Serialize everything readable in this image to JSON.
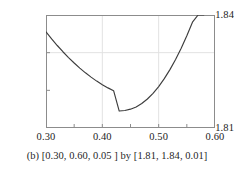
{
  "caption": {
    "text": "(b) [0.30, 0.60, 0.05 ] by [1.81, 1.84, 0.01]"
  },
  "chart_data": {
    "type": "line",
    "title": "",
    "subtitle": "",
    "xlabel": "",
    "ylabel": "",
    "xlim": [
      0.3,
      0.6
    ],
    "ylim": [
      1.81,
      1.84
    ],
    "x_tick_step": 0.05,
    "y_tick_step": 0.01,
    "x_tick_values": [
      0.3,
      0.35,
      0.4,
      0.45,
      0.5,
      0.55,
      0.6
    ],
    "y_tick_values": [
      1.81,
      1.82,
      1.83,
      1.84
    ],
    "x_tick_labels": [
      "0.30",
      "0.40",
      "0.50",
      "0.60"
    ],
    "x_tick_label_values": [
      0.3,
      0.4,
      0.5,
      0.6
    ],
    "y_tick_labels": [
      "1.84",
      "1.81"
    ],
    "y_tick_label_top": "1.84",
    "y_tick_label_bottom": "1.81",
    "grid": "faint interior gridlines at x = 0.40, 0.50 and y = 1.83",
    "grid_x_values": [
      0.4,
      0.5
    ],
    "grid_y_values": [
      1.83
    ],
    "legend": null,
    "legend_position": "none",
    "curve_color": "#3d3d3d",
    "axis_color": "#8c8c8c",
    "grid_color": "#e2e2e2",
    "background_color": "#ffffff",
    "series": [
      {
        "name": "curve",
        "description": "upward-opening parabola-like curve, minimum near x = 0.43",
        "minimum": {
          "x": 0.43,
          "y": 1.8145
        },
        "x": [
          0.3,
          0.31,
          0.32,
          0.33,
          0.34,
          0.35,
          0.36,
          0.37,
          0.38,
          0.39,
          0.4,
          0.41,
          0.42,
          0.43,
          0.44,
          0.45,
          0.46,
          0.47,
          0.48,
          0.49,
          0.5,
          0.51,
          0.52,
          0.53,
          0.54,
          0.55,
          0.56,
          0.57,
          0.58
        ],
        "y": [
          1.8355,
          1.83365,
          1.8319,
          1.83025,
          1.8287,
          1.82725,
          1.8259,
          1.82465,
          1.8235,
          1.82245,
          1.8215,
          1.82065,
          1.8199,
          1.8145,
          1.81465,
          1.815,
          1.8156,
          1.8165,
          1.8177,
          1.8192,
          1.821,
          1.8231,
          1.8255,
          1.8282,
          1.8312,
          1.8345,
          1.8381,
          1.84,
          1.84
        ]
      }
    ]
  },
  "axes": {
    "x_labels": [
      "0.30",
      "0.40",
      "0.50",
      "0.60"
    ],
    "y_label_top": "1.84",
    "y_label_bottom": "1.81"
  }
}
